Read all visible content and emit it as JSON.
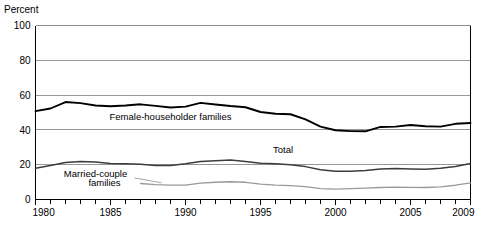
{
  "chart_data": {
    "type": "line",
    "title": "",
    "subtitle": "",
    "xlabel": "",
    "ylabel": "Percent",
    "ylim": [
      0,
      100
    ],
    "xlim": [
      1980,
      2009
    ],
    "yticks": [
      0,
      20,
      40,
      60,
      80,
      100
    ],
    "ytick_labels": [
      "0",
      "20",
      "40",
      "60",
      "80",
      "100"
    ],
    "xticks": [
      1980,
      1985,
      1990,
      1995,
      2000,
      2005,
      2009
    ],
    "xtick_labels": [
      "1980",
      "1985",
      "1990",
      "1995",
      "2000",
      "2005",
      "2009"
    ],
    "minor_xticks_every": 1,
    "grid": "horizontal",
    "legend_position": "inline-annotations",
    "x": [
      1980,
      1981,
      1982,
      1983,
      1984,
      1985,
      1986,
      1987,
      1988,
      1989,
      1990,
      1991,
      1992,
      1993,
      1994,
      1995,
      1996,
      1997,
      1998,
      1999,
      2000,
      2001,
      2002,
      2003,
      2004,
      2005,
      2006,
      2007,
      2008,
      2009
    ],
    "series": [
      {
        "name": "Female-householder families",
        "color": "#000000",
        "width": 1.9,
        "label_x": 1989.0,
        "label_y": 45.5,
        "values": [
          50.8,
          52.3,
          56.0,
          55.4,
          54.0,
          53.6,
          54.0,
          54.7,
          53.8,
          52.9,
          53.4,
          55.5,
          54.6,
          53.7,
          53.0,
          50.3,
          49.3,
          49.0,
          46.1,
          41.9,
          39.8,
          39.3,
          39.2,
          41.7,
          41.9,
          42.8,
          42.1,
          41.9,
          43.5,
          44.0
        ]
      },
      {
        "name": "Total",
        "color": "#3c3c3c",
        "width": 1.5,
        "label_x": 1996.5,
        "label_y": 27.0,
        "values": [
          17.9,
          19.5,
          21.3,
          21.8,
          21.5,
          20.7,
          20.5,
          20.3,
          19.5,
          19.6,
          20.6,
          21.8,
          22.3,
          22.7,
          21.8,
          20.8,
          20.5,
          19.9,
          18.9,
          17.1,
          16.2,
          16.3,
          16.7,
          17.6,
          17.8,
          17.6,
          17.4,
          18.0,
          19.0,
          20.7
        ]
      },
      {
        "name": "Married-couple families",
        "color": "#9a9a9a",
        "width": 1.3,
        "label_x": 1984.0,
        "label_y": 11.5,
        "start_year": 1987,
        "values": [
          null,
          null,
          null,
          null,
          null,
          null,
          null,
          9.2,
          8.6,
          8.3,
          8.3,
          9.4,
          9.9,
          10.2,
          9.9,
          8.8,
          8.3,
          8.0,
          7.4,
          6.3,
          6.0,
          6.2,
          6.5,
          6.9,
          7.1,
          7.0,
          6.9,
          7.3,
          8.2,
          9.6
        ]
      }
    ],
    "annotations": [
      {
        "text": "Female-householder families",
        "x": 1989.0,
        "y": 45.5
      },
      {
        "text": "Total",
        "x": 1996.5,
        "y": 27.0
      },
      {
        "text": "Married-couple",
        "x": 1984.0,
        "y": 13.0
      },
      {
        "text": "families",
        "x": 1984.6,
        "y": 7.5
      }
    ],
    "leader_lines": [
      {
        "from_x": 1986.6,
        "from_y": 12.4,
        "to_x": 1988.4,
        "to_y": 9.6
      }
    ]
  },
  "axis_label_top": "Percent",
  "colors": {
    "axis": "#000000",
    "gridline": "#8c8c8c",
    "plot_background": "#ffffff",
    "series_female_householder": "#000000",
    "series_total": "#3c3c3c",
    "series_married_couple": "#9a9a9a"
  }
}
